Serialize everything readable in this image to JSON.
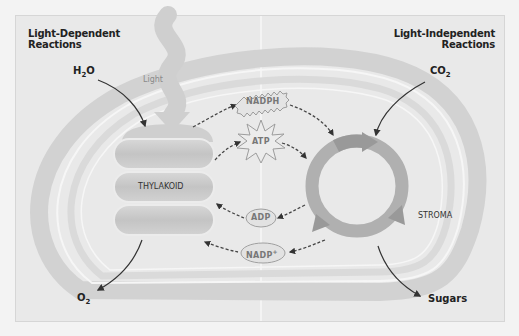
{
  "headings": {
    "left": [
      "Light-Dependent",
      "Reactions"
    ],
    "right": [
      "Light-Independent",
      "Reactions"
    ]
  },
  "inputs": {
    "water": {
      "base": "H",
      "sub": "2",
      "rest": "O"
    },
    "carbon_dioxide": {
      "base": "CO",
      "sub": "2"
    }
  },
  "outputs": {
    "oxygen": {
      "base": "O",
      "sub": "2"
    },
    "sugars": "Sugars"
  },
  "labels": {
    "light": "Light",
    "thylakoid": "THYLAKOID",
    "stroma": "STROMA"
  },
  "molecules": {
    "nadph": "NADPH",
    "atp": "ATP",
    "adp": "ADP",
    "nadp_base": "NADP",
    "nadp_sup": "+"
  },
  "colors": {
    "frame_bg": "#e9e9e9",
    "membrane_outer": "#d4d4d4",
    "membrane_inner": "#d9d9d9",
    "thylakoid_fill": "#c9c9c9",
    "cycle": "#a9a9a9",
    "arrow": "#333333",
    "molecule_fill": "#e2e2e2",
    "molecule_stroke": "#a0a0a0"
  }
}
